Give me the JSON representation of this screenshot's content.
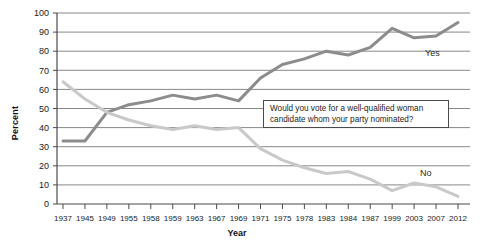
{
  "chart_data": {
    "type": "line",
    "title": "",
    "subtitle": "",
    "xlabel": "Year",
    "ylabel": "Percent",
    "ylim": [
      0,
      100
    ],
    "ytick_step": 10,
    "grid": "horizontal",
    "legend_position": "inline-right",
    "categories": [
      "1937",
      "1945",
      "1949",
      "1955",
      "1958",
      "1959",
      "1963",
      "1967",
      "1969",
      "1971",
      "1975",
      "1978",
      "1983",
      "1984",
      "1987",
      "1999",
      "2003",
      "2007",
      "2012"
    ],
    "yticks": [
      "0",
      "10",
      "20",
      "30",
      "40",
      "50",
      "60",
      "70",
      "80",
      "90",
      "100"
    ],
    "series": [
      {
        "name": "Yes",
        "color": "#8c8c8c",
        "values": [
          33,
          33,
          48,
          52,
          54,
          57,
          55,
          57,
          54,
          66,
          73,
          76,
          80,
          78,
          82,
          92,
          87,
          88,
          95
        ]
      },
      {
        "name": "No",
        "color": "#c9c9c9",
        "values": [
          64,
          55,
          48,
          44,
          41,
          39,
          41,
          39,
          40,
          29,
          23,
          19,
          16,
          17,
          13,
          7,
          11,
          9,
          4
        ]
      }
    ],
    "annotations": [
      {
        "id": "question-callout",
        "line1": "Would you vote for a well-qualified woman",
        "line2": "candidate whom your party nominated?"
      }
    ]
  },
  "colors": {
    "yes_line": "#8c8c8c",
    "no_line": "#c9c9c9",
    "gridline": "#7a7a7a",
    "axis": "#4a4a4a",
    "callout_border": "#4a4a4a",
    "background": "#ffffff"
  }
}
